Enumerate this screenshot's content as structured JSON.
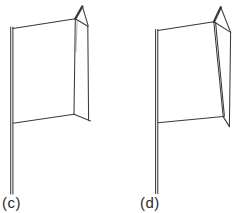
{
  "page": {
    "background": "#ffffff",
    "line_color": "#3a3a3a"
  },
  "figures": {
    "c": {
      "label": "(c)",
      "paths": {
        "pole_left": "M10.7,27 L10.7,194",
        "pole_right": "M12.9,27 L12.9,194",
        "panel_top": "M12.9,28.6 L75.3,18.8",
        "panel_right": "M75.3,18.8 L74,114.3",
        "panel_right_inner": "M77.2,20.2 L75.9,52",
        "panel_bottom": "M12.9,123.3 L74,114.3",
        "fold_top": "M75.3,18.8 L87.8,26.2",
        "fold_outer": "M87.8,26.2 L88.6,120.2",
        "fold_bottom": "M74,114.3 L90.6,120.9",
        "flap_right": "M82.4,6.4 L88.2,25.8",
        "flap_left": "M75.3,18.8 L82.4,6.4"
      }
    },
    "d": {
      "label": "(d)",
      "paths": {
        "pole_left": "M155.6,29.5 L155.6,193.5",
        "pole_right": "M157.8,29.5 L157.8,193.5",
        "panel_top": "M157.8,30.4 L214,21.7",
        "panel_right": "M213.8,21.7 L223.2,116.6",
        "panel_right_inner": "M215.6,22.6 L224.4,116.2",
        "panel_bottom": "M157.8,122.8 L223.2,116.6",
        "fold_top": "M214,21.7 L230.6,32.4",
        "fold_outer": "M230.6,32.4 L229.4,126.6",
        "fold_bottom": "M223.2,116.6 L229.4,126.6",
        "flap_right": "M220.8,7.3 L230.6,32.4",
        "flap_left": "M214,21.7 L220.8,7.3"
      }
    }
  }
}
